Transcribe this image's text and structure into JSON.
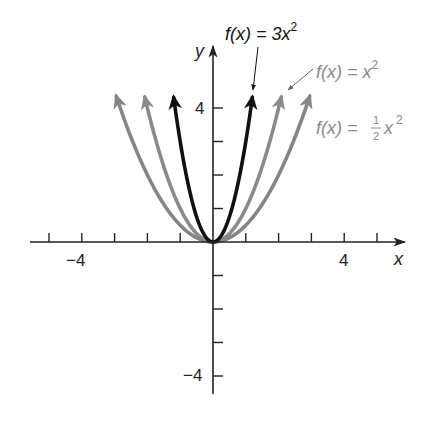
{
  "chart_data": {
    "type": "line",
    "title": "",
    "xlabel": "x",
    "ylabel": "y",
    "xlim": [
      -5.5,
      5.8
    ],
    "ylim": [
      -4.6,
      5.8
    ],
    "grid": false,
    "x_ticks": [
      -5,
      -4,
      -3,
      -2,
      -1,
      1,
      2,
      3,
      4,
      5
    ],
    "x_tick_labels": [
      {
        "value": -4,
        "label": "−4"
      },
      {
        "value": 4,
        "label": "4"
      }
    ],
    "y_ticks": [
      -4,
      -3,
      -2,
      -1,
      1,
      2,
      3,
      4
    ],
    "y_tick_labels": [
      {
        "value": 4,
        "label": "4"
      },
      {
        "value": -4,
        "label": "−4"
      }
    ],
    "series": [
      {
        "name": "f(x) = 3x²",
        "formula": "3x^2",
        "coefficient": 3,
        "color": "#111111",
        "x_range": [
          -1.2,
          1.2
        ],
        "arrows": "both",
        "points": [
          [
            -1.2,
            4.32
          ],
          [
            -1,
            3
          ],
          [
            -0.5,
            0.75
          ],
          [
            0,
            0
          ],
          [
            0.5,
            0.75
          ],
          [
            1,
            3
          ],
          [
            1.2,
            4.32
          ]
        ]
      },
      {
        "name": "f(x) = x²",
        "formula": "x^2",
        "coefficient": 1,
        "color": "#8a8a8a",
        "x_range": [
          -2.08,
          2.08
        ],
        "arrows": "both",
        "points": [
          [
            -2.08,
            4.33
          ],
          [
            -2,
            4
          ],
          [
            -1,
            1
          ],
          [
            0,
            0
          ],
          [
            1,
            1
          ],
          [
            2,
            4
          ],
          [
            2.08,
            4.33
          ]
        ]
      },
      {
        "name": "f(x) = ½x²",
        "formula": "0.5x^2",
        "coefficient": 0.5,
        "color": "#858585",
        "x_range": [
          -2.95,
          2.95
        ],
        "arrows": "both",
        "points": [
          [
            -2.95,
            4.35
          ],
          [
            -2,
            2
          ],
          [
            -1,
            0.5
          ],
          [
            0,
            0
          ],
          [
            1,
            0.5
          ],
          [
            2,
            2
          ],
          [
            2.95,
            4.35
          ]
        ]
      }
    ],
    "annotations": [
      {
        "text": "f(x) = 3x²",
        "target_series": 0,
        "color": "#111111"
      },
      {
        "text": "f(x) = x²",
        "target_series": 1,
        "color": "#8a8a8a"
      },
      {
        "text": "f(x) = ½x²",
        "target_series": 2,
        "color": "#8a8a8a"
      }
    ],
    "legend": null
  },
  "labels": {
    "x_axis": "x",
    "y_axis": "y",
    "x_neg4": "−4",
    "x_pos4": "4",
    "y_pos4": "4",
    "y_neg4": "−4",
    "fn_3x2_main": "f(x) = 3x",
    "fn_3x2_exp": "2",
    "fn_x2_main": "f(x) = x",
    "fn_x2_exp": "2",
    "fn_half_prefix": "f(x) = ",
    "fn_half_num": "1",
    "fn_half_den": "2",
    "fn_half_var": "x",
    "fn_half_exp": "2"
  }
}
